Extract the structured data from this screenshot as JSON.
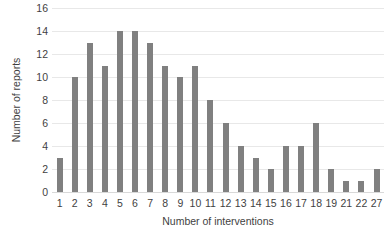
{
  "chart_data": {
    "type": "bar",
    "title": "",
    "xlabel": "Number of interventions",
    "ylabel": "Number of reports",
    "categories": [
      "1",
      "2",
      "3",
      "4",
      "5",
      "6",
      "7",
      "8",
      "9",
      "10",
      "11",
      "12",
      "13",
      "14",
      "15",
      "16",
      "17",
      "18",
      "19",
      "21",
      "22",
      "27"
    ],
    "values": [
      3,
      10,
      13,
      11,
      14,
      14,
      13,
      11,
      10,
      11,
      8,
      6,
      4,
      3,
      2,
      4,
      4,
      6,
      2,
      1,
      1,
      2
    ],
    "ylim": [
      0,
      16
    ],
    "yticks": [
      0,
      2,
      4,
      6,
      8,
      10,
      12,
      14,
      16
    ],
    "ytick_labels": [
      "0",
      "2",
      "4",
      "6",
      "8",
      "10",
      "12",
      "14",
      "16"
    ],
    "grid": true,
    "grid_axis": "y",
    "legend": false,
    "bar_color": "#808080",
    "grid_color": "#e8e8e8",
    "text_color": "#3f3f3f"
  }
}
